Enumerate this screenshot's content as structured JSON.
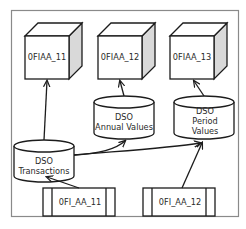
{
  "diagram": {
    "colors": {
      "frame": "#8a8a8a",
      "line": "#1c1c1c",
      "cube_side": "#d9d9d9",
      "text": "#2a2a2a"
    },
    "cubes": [
      {
        "id": "cube1",
        "label": "0FIAA_11"
      },
      {
        "id": "cube2",
        "label": "0FIAA_12"
      },
      {
        "id": "cube3",
        "label": "0FIAA_13"
      }
    ],
    "dsos": [
      {
        "id": "dso_annual",
        "lines": [
          "DSO",
          "Annual Values"
        ]
      },
      {
        "id": "dso_period",
        "lines": [
          "DSO",
          "Period",
          "Values"
        ]
      },
      {
        "id": "dso_trans",
        "lines": [
          "DSO",
          "Transactions"
        ]
      }
    ],
    "datasources": [
      {
        "id": "ds1",
        "label": "0FI_AA_11"
      },
      {
        "id": "ds2",
        "label": "0FI_AA_12"
      }
    ],
    "edges": [
      {
        "from": "ds1",
        "to": "dso_trans"
      },
      {
        "from": "ds2",
        "to": "dso_period"
      },
      {
        "from": "dso_trans",
        "to": "cube1"
      },
      {
        "from": "dso_trans",
        "to": "dso_annual"
      },
      {
        "from": "dso_trans",
        "to": "dso_period"
      },
      {
        "from": "dso_annual",
        "to": "cube2"
      },
      {
        "from": "dso_period",
        "to": "cube3"
      }
    ]
  }
}
